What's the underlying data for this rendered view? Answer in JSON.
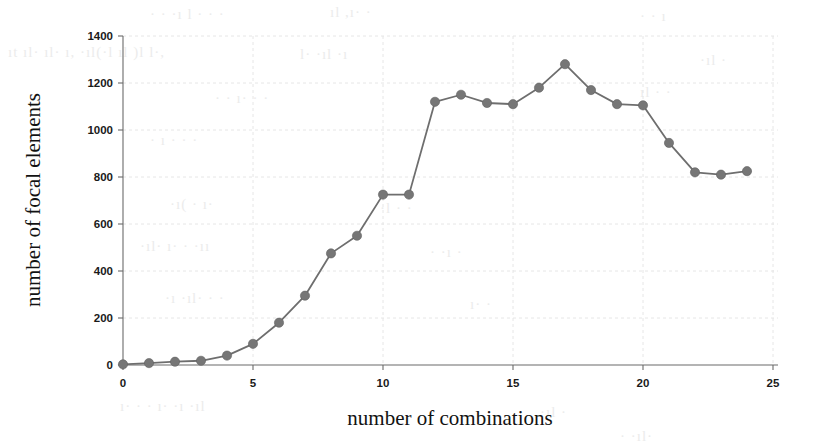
{
  "chart_data": {
    "type": "line",
    "title": "",
    "xlabel": "number of combinations",
    "ylabel": "number of focal elements",
    "xlim": [
      0,
      25
    ],
    "ylim": [
      0,
      1400
    ],
    "xticks": [
      0,
      5,
      10,
      15,
      20,
      25
    ],
    "xtick_labels": [
      "0",
      "5",
      "10",
      "15",
      "20",
      "25"
    ],
    "yticks": [
      0,
      200,
      400,
      600,
      800,
      1000,
      1200,
      1400
    ],
    "ytick_labels": [
      "0",
      "200",
      "400",
      "600",
      "800",
      "1000",
      "1200",
      "1400"
    ],
    "grid": true,
    "legend": null,
    "series": [
      {
        "name": "focal elements",
        "marker": "circle",
        "color": "#767676",
        "x": [
          0,
          1,
          2,
          3,
          4,
          5,
          6,
          7,
          8,
          9,
          10,
          11,
          12,
          13,
          14,
          15,
          16,
          17,
          18,
          19,
          20,
          21,
          22,
          23,
          24
        ],
        "values": [
          3,
          8,
          14,
          18,
          40,
          90,
          180,
          295,
          475,
          550,
          725,
          725,
          1120,
          1150,
          1115,
          1110,
          1180,
          1280,
          1170,
          1110,
          1105,
          945,
          820,
          810,
          825
        ]
      }
    ]
  },
  "artifacts": {
    "top_marks": [
      "a l",
      "lt",
      "o l",
      "t",
      ", t"
    ],
    "row2": [
      "th l",
      "h l",
      "t",
      "lo",
      "rl l l"
    ],
    "mid": [
      "l",
      "t",
      "i",
      "ll"
    ],
    "bottom": [
      "tl",
      "l i",
      "l",
      "t"
    ]
  }
}
